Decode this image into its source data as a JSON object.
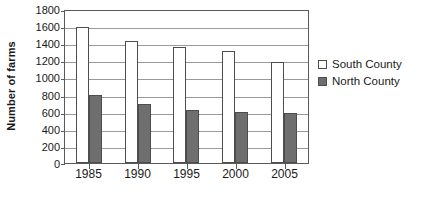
{
  "chart_data": {
    "type": "bar",
    "title": "",
    "subtitle": "",
    "xlabel": "",
    "ylabel": "Number of farms",
    "categories": [
      "1985",
      "1990",
      "1995",
      "2000",
      "2005"
    ],
    "series": [
      {
        "name": "South County",
        "color": "#ffffff",
        "values": [
          1590,
          1430,
          1355,
          1310,
          1180
        ]
      },
      {
        "name": "North County",
        "color": "#6e6e6e",
        "values": [
          800,
          690,
          620,
          595,
          580
        ]
      }
    ],
    "ylim": [
      0,
      1800
    ],
    "ytick_values": [
      0,
      200,
      400,
      600,
      800,
      1000,
      1200,
      1400,
      1600,
      1800
    ],
    "ytick_labels": [
      "0",
      "200",
      "400",
      "600",
      "800",
      "1000",
      "1200",
      "1400",
      "1600",
      "1800"
    ],
    "grid": true,
    "grid_axis": "y",
    "legend_position": "right",
    "legend_entries": [
      "South County",
      "North County"
    ],
    "annotations": []
  },
  "legend": {
    "south_label": "South County",
    "north_label": "North County"
  },
  "axes": {
    "y_title": "Number of farms"
  }
}
